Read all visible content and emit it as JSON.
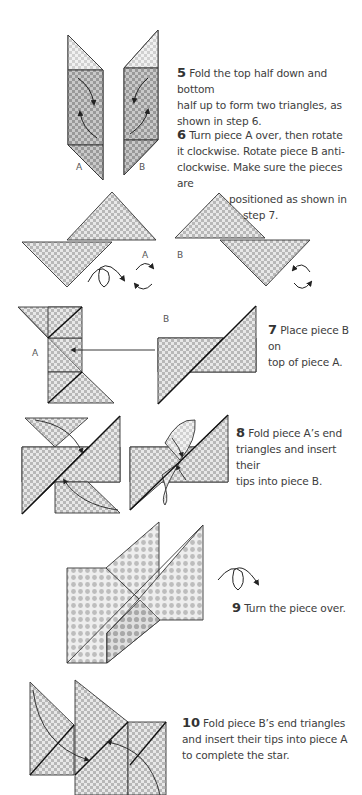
{
  "page": {
    "type": "origami-instructions",
    "colors": {
      "background": "#ffffff",
      "text": "#3d3d3d",
      "paper_light": "#e6e6e6",
      "paper_dark": "#b4b4b4",
      "outline": "#2b2b2b"
    }
  },
  "steps": [
    {
      "number": "5",
      "text": "Fold the top half down and bottom half up to form two triangles, as shown in step 6.",
      "lines": [
        "Fold the top half down and bottom",
        "half up to form two triangles, as",
        "shown in step 6."
      ],
      "labels": [
        "A",
        "B"
      ]
    },
    {
      "number": "6",
      "text": "Turn piece A over, then rotate it clockwise. Rotate piece B anti-clockwise. Make sure the pieces are positioned as shown in step 7.",
      "lines": [
        "Turn piece A over, then rotate",
        "it clockwise. Rotate piece B anti-",
        "clockwise. Make sure the pieces are",
        "positioned as shown in",
        "step 7."
      ],
      "labels": [
        "A",
        "B"
      ],
      "icons": [
        "turn-over-icon",
        "rotate-clockwise-icon",
        "rotate-anticlockwise-icon"
      ]
    },
    {
      "number": "7",
      "text": "Place piece B on top of piece A.",
      "lines": [
        "Place piece B on",
        "top of piece A."
      ],
      "labels": [
        "A",
        "B"
      ]
    },
    {
      "number": "8",
      "text": "Fold piece A's end triangles and insert their tips into piece B.",
      "lines": [
        "Fold piece A’s end",
        "triangles and insert their",
        "tips into piece B."
      ]
    },
    {
      "number": "9",
      "text": "Turn the piece over.",
      "lines": [
        "Turn the piece over."
      ],
      "icons": [
        "turn-over-icon"
      ]
    },
    {
      "number": "10",
      "text": "Fold piece B's end triangles and insert their tips into piece A to complete the star.",
      "lines": [
        "Fold piece B’s end triangles",
        "and insert their tips into piece A",
        "to complete the star."
      ]
    }
  ]
}
